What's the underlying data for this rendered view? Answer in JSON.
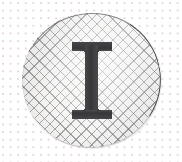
{
  "image": {
    "kind": "decorative-drop-cap",
    "width": 182,
    "height": 162,
    "alt_text": "Illuminated capital letter I on a cross-hatched circular badge"
  },
  "background": {
    "name": "dotted-graph-paper",
    "base_color": "#ffffff",
    "dot_color": "#e8d8db",
    "dot_spacing_px": 7.6,
    "dot_radius_px": 1.1
  },
  "badge": {
    "name": "hatched-circle",
    "shape": "circle",
    "left_px": 21,
    "top_px": 12,
    "width_px": 141,
    "height_px": 137,
    "fill_color": "#f3f2f1",
    "hatch_color": "#606062",
    "hatch_angle_deg": 45,
    "hatch_spacing_px": 7.4,
    "rim_color": "#3c3c3c"
  },
  "letter": {
    "name": "drop-cap-letter",
    "character": "I",
    "style": "slab-serif-roman-capital",
    "color": "#3b3b3d",
    "cap_height_px": 77,
    "serif_width_px": 40,
    "stem_width_px": 13
  }
}
